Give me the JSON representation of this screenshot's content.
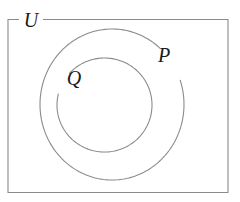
{
  "diagram": {
    "kind": "euler-diagram",
    "title": "",
    "background_color": "#ffffff",
    "line_color": "#8a8a8a",
    "label_color": "#1a1a1a",
    "universe": {
      "label": "U",
      "shape": "rectangle",
      "x": 8,
      "y": 19.5,
      "width": 220,
      "height": 173,
      "label_x": 31,
      "label_y": 27,
      "gap_start_x": 19,
      "gap_end_x": 43
    },
    "sets": [
      {
        "id": "P",
        "label": "P",
        "shape": "ellipse",
        "cx": 112,
        "cy": 104.5,
        "rx": 72,
        "ry": 75.5,
        "label_x": 164,
        "label_y": 62,
        "gap_start_deg": 312,
        "gap_end_deg": 341
      },
      {
        "id": "Q",
        "label": "Q",
        "shape": "ellipse",
        "cx": 104.5,
        "cy": 105,
        "rx": 47.5,
        "ry": 47,
        "label_x": 74,
        "label_y": 85,
        "gap_start_deg": 194,
        "gap_end_deg": 222
      }
    ]
  }
}
